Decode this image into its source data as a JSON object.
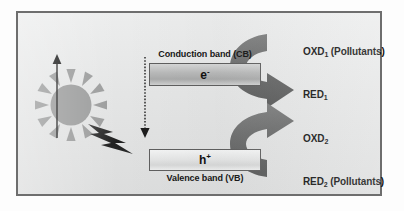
{
  "figure": {
    "type": "scientific-diagram",
    "panel": {
      "border_color": "#6e6e6e",
      "background_color": "#e6e7e7"
    }
  },
  "bands": {
    "conduction": {
      "caption": "Conduction band (CB)",
      "carrier_symbol": "e",
      "carrier_charge": "-",
      "box_fill": "#b9baba"
    },
    "valence": {
      "caption": "Valence band (VB)",
      "carrier_symbol": "h",
      "carrier_charge": "+",
      "box_fill": "#e4e5e5"
    }
  },
  "excitation": {
    "source_icon": "sun-icon",
    "energy_icon": "lightning-bolt-icon",
    "excitation_arrow": {
      "name": "electron-excitation-arrow",
      "style": "solid",
      "direction": "up",
      "color": "#1d1d1d"
    },
    "recombination_arrow": {
      "name": "recombination-arrow",
      "style": "dotted",
      "direction": "down",
      "color": "#1d1d1d"
    }
  },
  "reactions": {
    "reduction_arrow": {
      "name": "reduction-curved-arrow",
      "color": "#6c6d6d"
    },
    "oxidation_arrow": {
      "name": "oxidation-curved-arrow",
      "color": "#6c6d6d"
    },
    "labels": {
      "oxd1": "OXD",
      "oxd1_sub": "1",
      "oxd1_suffix": " (Pollutants)",
      "red1": "RED",
      "red1_sub": "1",
      "red1_suffix": "",
      "oxd2": "OXD",
      "oxd2_sub": "2",
      "oxd2_suffix": "",
      "red2": "RED",
      "red2_sub": "2",
      "red2_suffix": " (Pollutants)"
    }
  },
  "colors": {
    "sun": "#9b9c9c",
    "bolt": "#2a2a2a",
    "curved_arrow": "#6c6d6d",
    "text": "#101010"
  }
}
